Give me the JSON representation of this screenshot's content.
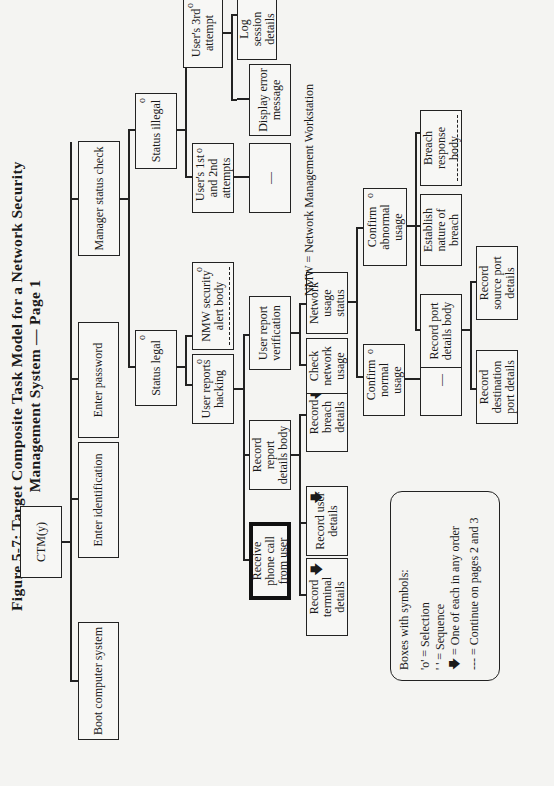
{
  "figure": {
    "title_line1": "Figure 5-7:  Target Composite Task Model for a Network Security",
    "title_line2": "Management System  —  Page 1",
    "abbreviation_note": "NMW = Network Management Workstation"
  },
  "nodes": {
    "root": {
      "label": "CTM(y)"
    },
    "boot": {
      "label": "Boot computer system"
    },
    "enter_id": {
      "label": "Enter identification"
    },
    "enter_pw": {
      "label": "Enter password"
    },
    "manager_check": {
      "label": "Manager status check"
    },
    "status_legal": {
      "label": "Status legal",
      "symbol": "o"
    },
    "status_illegal": {
      "label": "Status illegal",
      "symbol": "o"
    },
    "user_reports_hacking": {
      "label": "User reports hacking",
      "symbol": "o"
    },
    "nmw_alert": {
      "label": "NMW security alert body",
      "symbol": "o"
    },
    "user_1st_2nd": {
      "label": "User's 1st and 2nd attempts",
      "symbol": "o"
    },
    "user_3rd": {
      "label": "User's 3rd attempt",
      "symbol": "o"
    },
    "dash_1st_2nd": {
      "label": "—"
    },
    "display_error": {
      "label": "Display error message"
    },
    "log_session": {
      "label": "Log session details"
    },
    "shutdown": {
      "label": "Shut-down computer system"
    },
    "receive_call": {
      "label": "Receive phone call from user"
    },
    "record_report_body": {
      "label": "Record report details body"
    },
    "user_report_verification": {
      "label": "User report verification"
    },
    "record_terminal": {
      "label": "Record terminal details",
      "symbol": "🡇"
    },
    "record_user": {
      "label": "Record user details",
      "symbol": "🡇"
    },
    "record_breach": {
      "label": "Record breach details",
      "symbol": "🡇"
    },
    "check_network": {
      "label": "Check network usage"
    },
    "network_status": {
      "label": "Network usage status"
    },
    "confirm_normal": {
      "label": "Confirm normal usage",
      "symbol": "o"
    },
    "confirm_abnormal": {
      "label": "Confirm abnormal usage",
      "symbol": "o"
    },
    "dash_normal": {
      "label": "—"
    },
    "record_port_body": {
      "label": "Record port details body"
    },
    "establish_breach": {
      "label": "Establish nature of breach"
    },
    "breach_response": {
      "label": "Breach response body"
    },
    "record_dest_port": {
      "label": "Record destination port details"
    },
    "record_source_port": {
      "label": "Record source port details"
    }
  },
  "legend": {
    "heading": "Boxes with symbols:",
    "items": [
      {
        "symbol": "'o'",
        "meaning": "=  Selection"
      },
      {
        "symbol": "' '",
        "meaning": "=  Sequence"
      },
      {
        "symbol": "🡇",
        "meaning": "= One of each in any order"
      },
      {
        "symbol": "---",
        "meaning": "=  Continue on pages 2 and 3"
      }
    ]
  }
}
